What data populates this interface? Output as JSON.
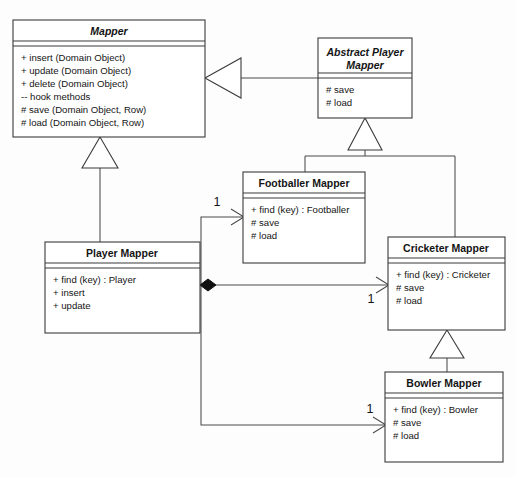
{
  "diagram": {
    "background_color": "#fdfdfd",
    "line_color": "#4a4a4a",
    "box_fill": "#ffffff",
    "box_stroke": "#3b3b3b"
  },
  "classes": {
    "mapper": {
      "name": "Mapper",
      "abstract": true,
      "members": [
        "+ insert (Domain Object)",
        "+ update (Domain Object)",
        "+ delete (Domain Object)",
        "-- hook methods",
        "# save (Domain Object, Row)",
        "# load (Domain Object, Row)"
      ]
    },
    "abstract_player_mapper": {
      "name_line1": "Abstract Player",
      "name_line2": "Mapper",
      "abstract": true,
      "members": [
        "# save",
        "# load"
      ]
    },
    "footballer_mapper": {
      "name": "Footballer Mapper",
      "abstract": false,
      "members": [
        "+ find (key) : Footballer",
        "# save",
        "# load"
      ]
    },
    "cricketer_mapper": {
      "name": "Cricketer Mapper",
      "abstract": false,
      "members": [
        "+ find (key) : Cricketer",
        "# save",
        "# load"
      ]
    },
    "bowler_mapper": {
      "name": "Bowler Mapper",
      "abstract": false,
      "members": [
        "+ find (key) : Bowler",
        "# save",
        "# load"
      ]
    },
    "player_mapper": {
      "name": "Player Mapper",
      "abstract": false,
      "members": [
        "+ find (key) : Player",
        "+ insert",
        "+ update"
      ]
    }
  },
  "multiplicities": {
    "to_footballer": "1",
    "to_cricketer": "1",
    "to_bowler": "1"
  },
  "relationships": [
    {
      "kind": "generalization",
      "from": "abstract_player_mapper",
      "to": "mapper"
    },
    {
      "kind": "generalization",
      "from": "player_mapper",
      "to": "mapper"
    },
    {
      "kind": "generalization",
      "from": "footballer_mapper",
      "to": "abstract_player_mapper"
    },
    {
      "kind": "generalization",
      "from": "cricketer_mapper",
      "to": "abstract_player_mapper"
    },
    {
      "kind": "generalization",
      "from": "bowler_mapper",
      "to": "cricketer_mapper"
    },
    {
      "kind": "composition",
      "from": "player_mapper",
      "to": "footballer_mapper",
      "multiplicity": "1"
    },
    {
      "kind": "composition",
      "from": "player_mapper",
      "to": "cricketer_mapper",
      "multiplicity": "1"
    },
    {
      "kind": "composition",
      "from": "player_mapper",
      "to": "bowler_mapper",
      "multiplicity": "1"
    }
  ]
}
